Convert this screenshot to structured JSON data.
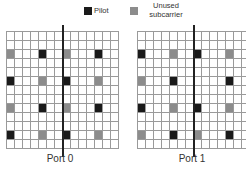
{
  "legend": {
    "pilot": {
      "label": "Pilot",
      "color": "#1a1a1a"
    },
    "unused": {
      "label_line1": "Unused",
      "label_line2": "subcarrier",
      "color": "#8c8c8c"
    }
  },
  "grid_spec": {
    "cols": 14,
    "rows": 13,
    "cell_w": 8,
    "cell_h": 9,
    "divider_after_col": 7,
    "line_color": "#9a9a9a",
    "divider_color": "#222222"
  },
  "ports": [
    {
      "label": "Port 0",
      "x": 6,
      "marks": [
        {
          "row": 2,
          "col": 0,
          "type": "unused"
        },
        {
          "row": 2,
          "col": 4,
          "type": "pilot"
        },
        {
          "row": 2,
          "col": 7,
          "type": "unused"
        },
        {
          "row": 2,
          "col": 11,
          "type": "pilot"
        },
        {
          "row": 5,
          "col": 0,
          "type": "pilot"
        },
        {
          "row": 5,
          "col": 4,
          "type": "unused"
        },
        {
          "row": 5,
          "col": 7,
          "type": "pilot"
        },
        {
          "row": 5,
          "col": 11,
          "type": "unused"
        },
        {
          "row": 8,
          "col": 0,
          "type": "unused"
        },
        {
          "row": 8,
          "col": 4,
          "type": "pilot"
        },
        {
          "row": 8,
          "col": 7,
          "type": "unused"
        },
        {
          "row": 8,
          "col": 11,
          "type": "pilot"
        },
        {
          "row": 11,
          "col": 0,
          "type": "pilot"
        },
        {
          "row": 11,
          "col": 4,
          "type": "unused"
        },
        {
          "row": 11,
          "col": 7,
          "type": "pilot"
        },
        {
          "row": 11,
          "col": 11,
          "type": "unused"
        }
      ]
    },
    {
      "label": "Port 1",
      "x": 137,
      "marks": [
        {
          "row": 2,
          "col": 0,
          "type": "pilot"
        },
        {
          "row": 2,
          "col": 4,
          "type": "unused"
        },
        {
          "row": 2,
          "col": 7,
          "type": "pilot"
        },
        {
          "row": 2,
          "col": 11,
          "type": "unused"
        },
        {
          "row": 5,
          "col": 0,
          "type": "unused"
        },
        {
          "row": 5,
          "col": 4,
          "type": "pilot"
        },
        {
          "row": 5,
          "col": 11,
          "type": "pilot"
        },
        {
          "row": 8,
          "col": 0,
          "type": "pilot"
        },
        {
          "row": 8,
          "col": 4,
          "type": "unused"
        },
        {
          "row": 8,
          "col": 7,
          "type": "pilot"
        },
        {
          "row": 8,
          "col": 11,
          "type": "unused"
        },
        {
          "row": 11,
          "col": 0,
          "type": "unused"
        },
        {
          "row": 11,
          "col": 4,
          "type": "pilot"
        },
        {
          "row": 11,
          "col": 7,
          "type": "unused"
        },
        {
          "row": 11,
          "col": 11,
          "type": "pilot"
        }
      ]
    }
  ]
}
